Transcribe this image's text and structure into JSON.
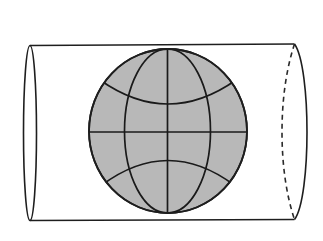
{
  "diagram": {
    "colors": {
      "background": "#ffffff",
      "globe_fill": "#b8b8b8",
      "line": "#1e1e1e"
    },
    "cylinder": {
      "top_edge_y": 45,
      "bottom_edge_y": 220,
      "left_ellipse": {
        "cx": 30,
        "rx": 6.5,
        "style": "solid"
      },
      "right_ellipse": {
        "cx": 294.5,
        "rx": 12.5,
        "front_style": "solid",
        "back_style": "dashed"
      }
    },
    "globe": {
      "cx": 168,
      "cy": 131,
      "rx": 79,
      "ry": 82,
      "meridians": [
        "center",
        "inner-left",
        "inner-right"
      ],
      "parallels": [
        "equator",
        "northern",
        "southern"
      ]
    }
  }
}
